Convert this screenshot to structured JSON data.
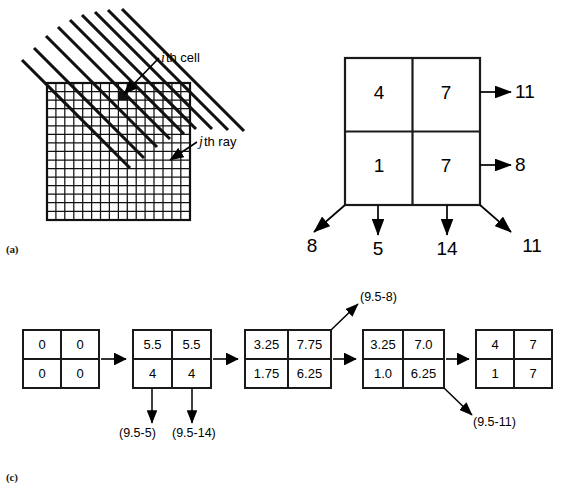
{
  "figure": {
    "panels": [
      {
        "id": "a",
        "label": "(a)"
      },
      {
        "id": "b",
        "label": "(b)"
      },
      {
        "id": "c",
        "label": "(c)"
      }
    ]
  },
  "panel_a": {
    "label": "(a)",
    "annotations": [
      {
        "name": "ith-cell",
        "italic": "i",
        "rest": "th cell"
      },
      {
        "name": "jth-ray",
        "italic": "j",
        "rest": "th ray"
      }
    ],
    "grid": {
      "rows": 16,
      "cols": 16
    },
    "rays": {
      "count": 9,
      "angle_deg": 45,
      "direction": "upper-left to lower-right"
    }
  },
  "panel_b": {
    "label": "(b)",
    "grid": {
      "rows": 2,
      "cols": 2,
      "values": [
        [
          "4",
          "7"
        ],
        [
          "1",
          "7"
        ]
      ]
    },
    "row_sums": [
      "11",
      "8"
    ],
    "column_sums": [
      "5",
      "14"
    ],
    "diagonal_sums": {
      "left": "8",
      "right": "11"
    }
  },
  "panel_c": {
    "label": "(c)",
    "steps": [
      {
        "name": "grid-0",
        "values": [
          [
            "0",
            "0"
          ],
          [
            "0",
            "0"
          ]
        ]
      },
      {
        "name": "grid-1",
        "values": [
          [
            "5.5",
            "5.5"
          ],
          [
            "4",
            "4"
          ]
        ]
      },
      {
        "name": "grid-2",
        "values": [
          [
            "3.25",
            "7.75"
          ],
          [
            "1.75",
            "6.25"
          ]
        ]
      },
      {
        "name": "grid-3",
        "values": [
          [
            "3.25",
            "7.0"
          ],
          [
            "1.0",
            "6.25"
          ]
        ]
      },
      {
        "name": "grid-4",
        "values": [
          [
            "4",
            "7"
          ],
          [
            "1",
            "7"
          ]
        ]
      }
    ],
    "corrections": [
      {
        "name": "correction-col-1",
        "text": "(9.5-5)"
      },
      {
        "name": "correction-col-2",
        "text": "(9.5-14)"
      },
      {
        "name": "correction-diag-upper",
        "text": "(9.5-8)"
      },
      {
        "name": "correction-diag-lower",
        "text": "(9.5-11)"
      }
    ]
  },
  "colors": {
    "ink": "#000000",
    "paper": "#ffffff",
    "line": "#1a1a1a"
  }
}
